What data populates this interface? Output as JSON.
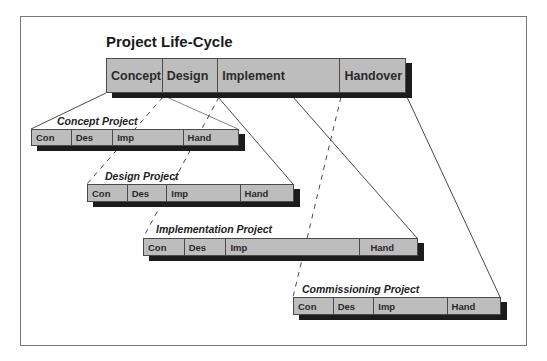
{
  "diagram": {
    "title": "Project Life-Cycle",
    "main_phases": [
      {
        "label": "Concept",
        "width": 56
      },
      {
        "label": "Design",
        "width": 56
      },
      {
        "label": "Implement",
        "width": 123
      },
      {
        "label": "Handover",
        "width": 64
      }
    ],
    "sub_projects": [
      {
        "name": "Concept Project",
        "phases": [
          {
            "label": "Con",
            "width": 40
          },
          {
            "label": "Des",
            "width": 42
          },
          {
            "label": "Imp",
            "width": 71
          },
          {
            "label": "Hand",
            "width": 54
          }
        ]
      },
      {
        "name": "Design Project",
        "phases": [
          {
            "label": "Con",
            "width": 40
          },
          {
            "label": "Des",
            "width": 40
          },
          {
            "label": "Imp",
            "width": 74
          },
          {
            "label": "Hand",
            "width": 52
          }
        ]
      },
      {
        "name": "Implementation Project",
        "phases": [
          {
            "label": "Con",
            "width": 41
          },
          {
            "label": "Des",
            "width": 42
          },
          {
            "label": "Imp",
            "width": 135
          },
          {
            "label": "Hand",
            "width": 56
          }
        ]
      },
      {
        "name": "Commissioning Project",
        "phases": [
          {
            "label": "Con",
            "width": 40
          },
          {
            "label": "Des",
            "width": 41
          },
          {
            "label": "Imp",
            "width": 74
          },
          {
            "label": "Hand",
            "width": 52
          }
        ]
      }
    ],
    "colors": {
      "bar_fill": "#bdbdbd",
      "bar_shadow": "#1c1c1c",
      "border": "#4a4a4a",
      "line": "#333333"
    }
  }
}
